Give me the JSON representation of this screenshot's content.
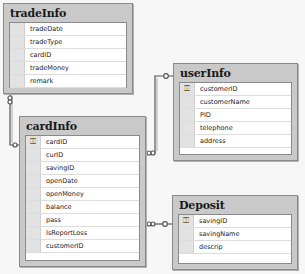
{
  "tables": {
    "tradeInfo": {
      "title": "tradeInfo",
      "columns": [
        {
          "name": "tradeDate",
          "pk": false
        },
        {
          "name": "tradeType",
          "pk": false
        },
        {
          "name": "cardID",
          "pk": false
        },
        {
          "name": "tradeMoney",
          "pk": false
        },
        {
          "name": "remark",
          "pk": false
        }
      ]
    },
    "cardInfo": {
      "title": "cardInfo",
      "columns": [
        {
          "name": "cardID",
          "pk": true
        },
        {
          "name": "curID",
          "pk": false
        },
        {
          "name": "savingID",
          "pk": false
        },
        {
          "name": "openDate",
          "pk": false
        },
        {
          "name": "openMoney",
          "pk": false
        },
        {
          "name": "balance",
          "pk": false
        },
        {
          "name": "pass",
          "pk": false
        },
        {
          "name": "IsReportLoss",
          "pk": false
        },
        {
          "name": "customerID",
          "pk": false
        }
      ]
    },
    "userInfo": {
      "title": "userInfo",
      "columns": [
        {
          "name": "customerID",
          "pk": true
        },
        {
          "name": "customerName",
          "pk": false
        },
        {
          "name": "PID",
          "pk": false
        },
        {
          "name": "telephone",
          "pk": false
        },
        {
          "name": "address",
          "pk": false
        }
      ]
    },
    "Deposit": {
      "title": "Deposit",
      "columns": [
        {
          "name": "savingID",
          "pk": true
        },
        {
          "name": "savingName",
          "pk": false
        },
        {
          "name": "descrip",
          "pk": false
        }
      ]
    }
  },
  "relationships": [
    {
      "from": "tradeInfo",
      "to": "cardInfo",
      "label": "tradeInfo.cardID -> cardInfo.cardID"
    },
    {
      "from": "cardInfo",
      "to": "userInfo",
      "label": "cardInfo.customerID -> userInfo.customerID"
    },
    {
      "from": "cardInfo",
      "to": "Deposit",
      "label": "cardInfo.savingID -> Deposit.savingID"
    }
  ],
  "icons": {
    "pk": "⚿"
  }
}
